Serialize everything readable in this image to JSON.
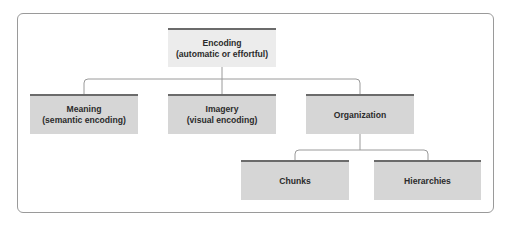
{
  "diagram": {
    "root": {
      "label_line1": "Encoding",
      "label_line2": "(automatic or effortful)"
    },
    "level2": [
      {
        "label_line1": "Meaning",
        "label_line2": "(semantic encoding)"
      },
      {
        "label_line1": "Imagery",
        "label_line2": "(visual encoding)"
      },
      {
        "label_line1": "Organization",
        "label_line2": ""
      }
    ],
    "level3": [
      {
        "label_line1": "Chunks",
        "parent": "Organization"
      },
      {
        "label_line1": "Hierarchies",
        "parent": "Organization"
      }
    ],
    "colors": {
      "root_fill": "#ececec",
      "node_fill": "#d6d6d6",
      "top_rule": "#6b6b6b",
      "connector": "#9a9a9a",
      "frame": "#9a9a9a",
      "text": "#2b2b2b"
    }
  }
}
